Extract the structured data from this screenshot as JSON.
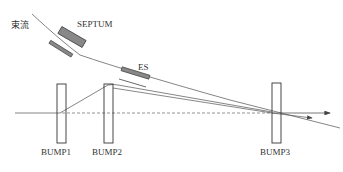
{
  "diagram": {
    "labels": {
      "beam": "束流",
      "septum": "SEPTUM",
      "es": "ES",
      "bump1": "BUMP1",
      "bump2": "BUMP2",
      "bump3": "BUMP3"
    },
    "colors": {
      "line": "#555555",
      "element_fill": "#888888",
      "dashed": "#666666"
    }
  }
}
